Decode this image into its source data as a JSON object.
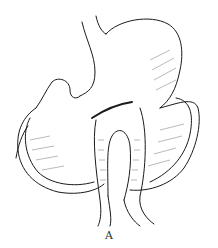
{
  "figure": {
    "caption": "A",
    "colors": {
      "ink": "#1a1a1a",
      "background": "#ffffff"
    }
  }
}
